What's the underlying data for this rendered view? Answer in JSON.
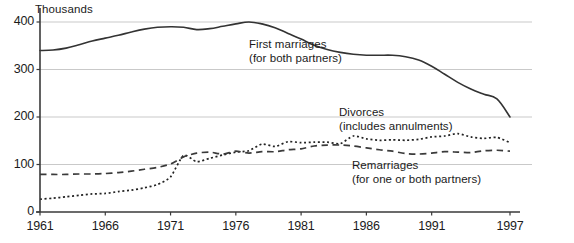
{
  "chart_data": {
    "type": "line",
    "title": "",
    "subtitle": "",
    "units_label": "Thousands",
    "xlabel": "",
    "ylabel": "",
    "xlim": [
      1961,
      1998
    ],
    "ylim": [
      0,
      430
    ],
    "grid": true,
    "gridlines_y": [
      100,
      200,
      300,
      400
    ],
    "legend_position": "inline-annotations",
    "x_ticks": [
      {
        "value": 1961,
        "label": "1961"
      },
      {
        "value": 1966,
        "label": "1966"
      },
      {
        "value": 1971,
        "label": "1971"
      },
      {
        "value": 1976,
        "label": "1976"
      },
      {
        "value": 1981,
        "label": "1981"
      },
      {
        "value": 1986,
        "label": "1986"
      },
      {
        "value": 1991,
        "label": "1991"
      },
      {
        "value": 1997,
        "label": "1997"
      }
    ],
    "y_ticks": [
      {
        "value": 0,
        "label": "0"
      },
      {
        "value": 100,
        "label": "100"
      },
      {
        "value": 200,
        "label": "200"
      },
      {
        "value": 300,
        "label": "300"
      },
      {
        "value": 400,
        "label": "400"
      }
    ],
    "x": [
      1961,
      1962,
      1963,
      1964,
      1965,
      1966,
      1967,
      1968,
      1969,
      1970,
      1971,
      1972,
      1973,
      1974,
      1975,
      1976,
      1977,
      1978,
      1979,
      1980,
      1981,
      1982,
      1983,
      1984,
      1985,
      1986,
      1987,
      1988,
      1989,
      1990,
      1991,
      1992,
      1993,
      1994,
      1995,
      1996,
      1997
    ],
    "series": [
      {
        "name": "First marriages",
        "qualifier": "(for both partners)",
        "style": "solid",
        "color": "#333333",
        "annotation_line1": "First marriages",
        "annotation_line2": "(for both partners)",
        "values": [
          340,
          341,
          345,
          352,
          360,
          366,
          372,
          379,
          385,
          389,
          390,
          389,
          384,
          386,
          391,
          396,
          400,
          396,
          388,
          376,
          364,
          351,
          342,
          336,
          332,
          330,
          330,
          330,
          327,
          320,
          307,
          290,
          273,
          259,
          248,
          238,
          200
        ]
      },
      {
        "name": "Divorces",
        "qualifier": "(includes annulments)",
        "style": "dotted",
        "color": "#222222",
        "annotation_line1": "Divorces",
        "annotation_line2": "(includes annulments)",
        "values": [
          27,
          29,
          32,
          35,
          38,
          39,
          43,
          46,
          51,
          58,
          74,
          119,
          106,
          113,
          120,
          126,
          129,
          143,
          138,
          148,
          146,
          147,
          147,
          144,
          160,
          154,
          151,
          152,
          151,
          153,
          158,
          160,
          165,
          158,
          155,
          157,
          146
        ]
      },
      {
        "name": "Remarriages",
        "qualifier": "(for one or both partners)",
        "style": "dashed",
        "color": "#3a3a3a",
        "annotation_line1": "Remarriages",
        "annotation_line2": "(for one or both partners)",
        "values": [
          79,
          79,
          79,
          80,
          80,
          81,
          83,
          86,
          90,
          94,
          101,
          116,
          124,
          126,
          122,
          128,
          124,
          127,
          127,
          131,
          133,
          139,
          141,
          141,
          139,
          135,
          131,
          128,
          123,
          122,
          124,
          127,
          126,
          125,
          129,
          130,
          128
        ]
      }
    ],
    "annotations": [
      {
        "name": "first-marriages-annotation",
        "line1": "First marriages",
        "line2": "(for both partners)",
        "x_px": 249,
        "y_px": 38
      },
      {
        "name": "divorces-annotation",
        "line1": "Divorces",
        "line2": "(includes annulments)",
        "x_px": 339,
        "y_px": 106
      },
      {
        "name": "remarriages-annotation",
        "line1": "Remarriages",
        "line2": "(for one or both partners)",
        "x_px": 352,
        "y_px": 159
      }
    ]
  },
  "axes": {
    "plot_left_px": 40,
    "plot_right_px": 532,
    "plot_top_px": 8,
    "plot_bottom_px": 212,
    "axis_color": "#3a3a3a",
    "grid_color": "#c9c9c9"
  }
}
